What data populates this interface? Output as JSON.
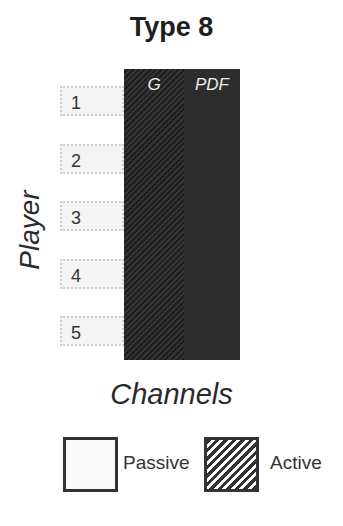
{
  "title": "Type 8",
  "y_axis_label": "Player",
  "x_axis_label": "Channels",
  "channels": [
    {
      "label": "G",
      "state": "Active"
    },
    {
      "label": "PDF",
      "state": "Active"
    }
  ],
  "players": [
    "1",
    "2",
    "3",
    "4",
    "5"
  ],
  "legend": {
    "passive": "Passive",
    "active": "Active"
  },
  "colors": {
    "active_fill": "#2b2b2b",
    "passive_fill": "#f4f4f4"
  }
}
